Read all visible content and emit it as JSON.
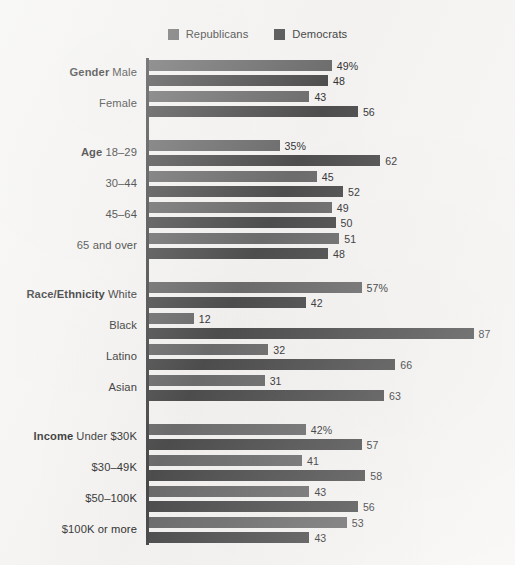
{
  "legend": {
    "items": [
      {
        "label": "Republicans",
        "color": "#6d6d6d",
        "key": "republicans"
      },
      {
        "label": "Democrats",
        "color": "#4e4e4e",
        "key": "democrats"
      }
    ]
  },
  "chart_data": {
    "type": "bar",
    "orientation": "horizontal",
    "title": "",
    "subtitle": "",
    "xlabel": "",
    "ylabel": "",
    "xlim": [
      0,
      100
    ],
    "grid": false,
    "legend_position": "top-center",
    "value_suffix_first_row_of_section": "%",
    "series": [
      {
        "name": "Republicans",
        "color": "#6d6d6d",
        "values": [
          49,
          43,
          35,
          45,
          49,
          51,
          57,
          12,
          32,
          31,
          42,
          41,
          43,
          53
        ]
      },
      {
        "name": "Democrats",
        "color": "#4e4e4e",
        "values": [
          48,
          56,
          62,
          52,
          50,
          48,
          42,
          87,
          66,
          63,
          57,
          58,
          56,
          43
        ]
      }
    ],
    "sections": [
      {
        "name": "Gender",
        "rows": [
          {
            "label": "Male",
            "republicans": 49,
            "democrats": 48,
            "rep_display": "49%",
            "dem_display": "48"
          },
          {
            "label": "Female",
            "republicans": 43,
            "democrats": 56,
            "rep_display": "43",
            "dem_display": "56"
          }
        ]
      },
      {
        "name": "Age",
        "rows": [
          {
            "label": "18–29",
            "republicans": 35,
            "democrats": 62,
            "rep_display": "35%",
            "dem_display": "62"
          },
          {
            "label": "30–44",
            "republicans": 45,
            "democrats": 52,
            "rep_display": "45",
            "dem_display": "52"
          },
          {
            "label": "45–64",
            "republicans": 49,
            "democrats": 50,
            "rep_display": "49",
            "dem_display": "50"
          },
          {
            "label": "65 and over",
            "republicans": 51,
            "democrats": 48,
            "rep_display": "51",
            "dem_display": "48"
          }
        ]
      },
      {
        "name": "Race/Ethnicity",
        "rows": [
          {
            "label": "White",
            "republicans": 57,
            "democrats": 42,
            "rep_display": "57%",
            "dem_display": "42"
          },
          {
            "label": "Black",
            "republicans": 12,
            "democrats": 87,
            "rep_display": "12",
            "dem_display": "87"
          },
          {
            "label": "Latino",
            "republicans": 32,
            "democrats": 66,
            "rep_display": "32",
            "dem_display": "66"
          },
          {
            "label": "Asian",
            "republicans": 31,
            "democrats": 63,
            "rep_display": "31",
            "dem_display": "63"
          }
        ]
      },
      {
        "name": "Income",
        "rows": [
          {
            "label": "Under $30K",
            "republicans": 42,
            "democrats": 57,
            "rep_display": "42%",
            "dem_display": "57"
          },
          {
            "label": "$30–49K",
            "republicans": 41,
            "democrats": 58,
            "rep_display": "41",
            "dem_display": "58"
          },
          {
            "label": "$50–100K",
            "republicans": 43,
            "democrats": 56,
            "rep_display": "43",
            "dem_display": "56"
          },
          {
            "label": "$100K or more",
            "republicans": 53,
            "democrats": 43,
            "rep_display": "53",
            "dem_display": "43"
          }
        ]
      }
    ]
  },
  "layout": {
    "px_per_unit": 3.73,
    "bar_height": 11,
    "bar_gap": 4,
    "row_gap": 5,
    "section_gap": 18,
    "plot_top": 4
  }
}
